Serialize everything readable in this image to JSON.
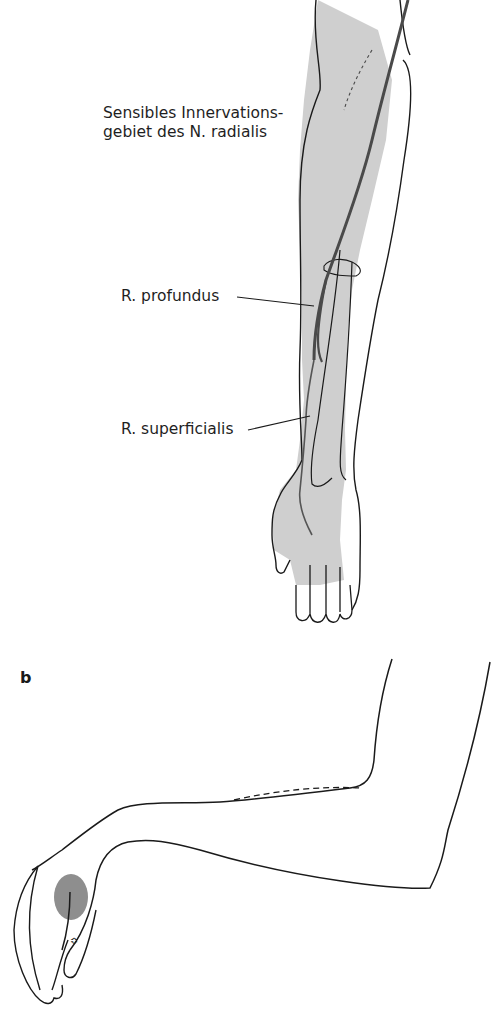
{
  "figure": {
    "panel_a": {
      "shaded_area_label_line1": "Sensibles Innervations-",
      "shaded_area_label_line2": "gebiet des N. radialis",
      "labels": [
        {
          "text": "R. profundus"
        },
        {
          "text": "R. superficialis"
        }
      ]
    },
    "panel_b": {
      "letter": "b"
    },
    "colors": {
      "shading": "#c8c8c8",
      "nerve": "#555555",
      "outline": "#1a1a1a",
      "patch": "#8e8e8e"
    }
  }
}
